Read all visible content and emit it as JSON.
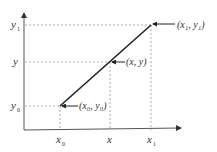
{
  "diagram": {
    "type": "linear-interpolation-plot",
    "colors": {
      "axis": "#555555",
      "line": "#222222",
      "dashed": "#999999",
      "text": "#333333"
    },
    "axes": {
      "y_ticks": [
        {
          "base": "y",
          "sub": "1"
        },
        {
          "base": "y",
          "sub": ""
        },
        {
          "base": "y",
          "sub": "0"
        }
      ],
      "x_ticks": [
        {
          "base": "x",
          "sub": "0"
        },
        {
          "base": "x",
          "sub": ""
        },
        {
          "base": "x",
          "sub": "1"
        }
      ]
    },
    "points": [
      {
        "label": "(x₀, y₀)"
      },
      {
        "label": "(x, y)"
      },
      {
        "label": "(x₁, y₁)"
      }
    ]
  }
}
